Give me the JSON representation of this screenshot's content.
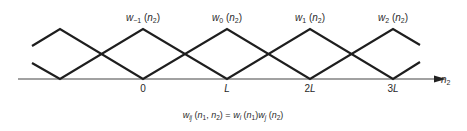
{
  "diagram": {
    "type": "overlapping triangular window functions",
    "axis": {
      "variable": "n",
      "variable_subscript": "2",
      "ticks": [
        {
          "label": "0",
          "x": 143
        },
        {
          "label": "L",
          "x": 227
        },
        {
          "label": "2L",
          "x": 310
        },
        {
          "label": "3L",
          "x": 393
        }
      ]
    },
    "curves": [
      {
        "name": "w",
        "index": "−1",
        "arg": "n",
        "arg_sub": "2",
        "peak_x": 143
      },
      {
        "name": "w",
        "index": "0",
        "arg": "n",
        "arg_sub": "2",
        "peak_x": 227
      },
      {
        "name": "w",
        "index": "1",
        "arg": "n",
        "arg_sub": "2",
        "peak_x": 310
      },
      {
        "name": "w",
        "index": "2",
        "arg": "n",
        "arg_sub": "2",
        "peak_x": 393
      }
    ],
    "formula": {
      "lhs_name": "w",
      "lhs_sub": "ij",
      "lhs_args": "(n1, n2)",
      "rhs": "= wi(n1)wj(n2)"
    },
    "colors": {
      "line": "#1e1e1e",
      "text": "#2a2a2a",
      "background": "#ffffff"
    }
  }
}
